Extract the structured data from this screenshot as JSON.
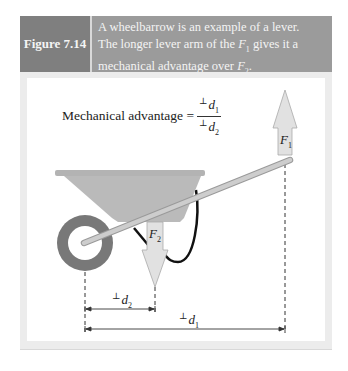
{
  "header": {
    "figure_label": "Figure 7.14",
    "caption_line1": "A wheelbarrow is an example of a lever.",
    "caption_line2_pre": "The longer lever arm of the ",
    "caption_line2_sym": "F",
    "caption_line2_sub": "1",
    "caption_line2_post": " gives it a",
    "caption_line3_pre": "mechanical advantage over ",
    "caption_line3_sym": "F",
    "caption_line3_sub": "2",
    "caption_line3_post": "."
  },
  "formula": {
    "label": "Mechanical advantage =",
    "perp": "⊥",
    "num_sym": "d",
    "num_sub": "1",
    "den_sym": "d",
    "den_sub": "2"
  },
  "labels": {
    "f1_sym": "F",
    "f1_sub": "1",
    "f2_sym": "F",
    "f2_sub": "2",
    "d1_perp": "⊥",
    "d1_sym": "d",
    "d1_sub": "1",
    "d2_perp": "⊥",
    "d2_sym": "d",
    "d2_sub": "2"
  },
  "colors": {
    "header_label_bg": "#7f7f7f",
    "header_caption_bg": "#9b9b9b",
    "tray": "#b9b9b9",
    "wheel": "#7a7a7a",
    "arrow_fill": "#dcdcdc",
    "handle": "#c4c4c4"
  }
}
